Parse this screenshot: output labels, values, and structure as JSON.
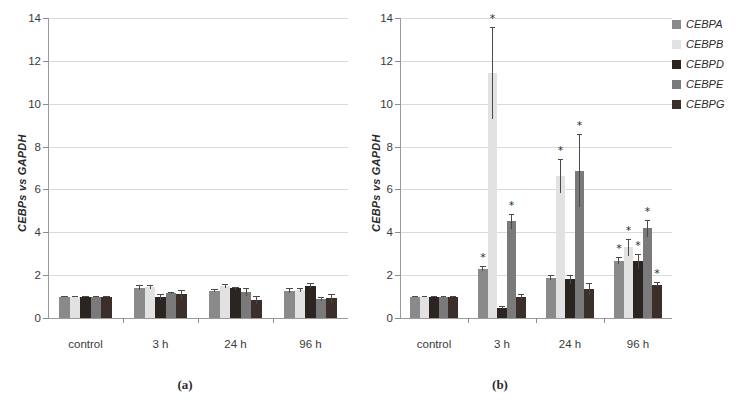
{
  "figure": {
    "panel_a_caption": "(a)",
    "panel_b_caption": "(b)"
  },
  "legend": {
    "items": [
      {
        "label": "CEBPA",
        "color": "#8a8a8a"
      },
      {
        "label": "CEBPB",
        "color": "#e2e2e2"
      },
      {
        "label": "CEBPD",
        "color": "#2b2420"
      },
      {
        "label": "CEBPE",
        "color": "#7a7a7a"
      },
      {
        "label": "CEBPG",
        "color": "#3c2e28"
      }
    ]
  },
  "axis": {
    "ylabel": "CEBPs vs GAPDH",
    "yticks": [
      "0",
      "2",
      "4",
      "6",
      "8",
      "10",
      "12",
      "14"
    ],
    "xticklabels": [
      "control",
      "3 h",
      "24 h",
      "96 h"
    ]
  },
  "chart_data": [
    {
      "type": "bar",
      "panel": "(a)",
      "title": "",
      "xlabel": "",
      "ylabel": "CEBPs vs GAPDH",
      "ylim": [
        0,
        14
      ],
      "ytick_step": 2,
      "grid": true,
      "legend_position": "right-outside-panel-b",
      "categories": [
        "control",
        "3 h",
        "24 h",
        "96 h"
      ],
      "series": [
        {
          "name": "CEBPA",
          "color": "#8a8a8a",
          "values": [
            1.0,
            1.42,
            1.28,
            1.27
          ],
          "errors": [
            0.03,
            0.12,
            0.09,
            0.12
          ],
          "significant": [
            false,
            false,
            false,
            false
          ]
        },
        {
          "name": "CEBPB",
          "color": "#e2e2e2",
          "values": [
            1.0,
            1.45,
            1.48,
            1.32
          ],
          "errors": [
            0.03,
            0.1,
            0.1,
            0.1
          ],
          "significant": [
            false,
            false,
            false,
            false
          ]
        },
        {
          "name": "CEBPD",
          "color": "#2b2420",
          "values": [
            1.0,
            0.98,
            1.38,
            1.5
          ],
          "errors": [
            0.03,
            0.12,
            0.09,
            0.12
          ],
          "significant": [
            false,
            false,
            false,
            false
          ]
        },
        {
          "name": "CEBPE",
          "color": "#7a7a7a",
          "values": [
            1.0,
            1.18,
            1.22,
            0.88
          ],
          "errors": [
            0.03,
            0.05,
            0.2,
            0.08
          ],
          "significant": [
            false,
            false,
            false,
            false
          ]
        },
        {
          "name": "CEBPG",
          "color": "#3c2e28",
          "values": [
            1.0,
            1.1,
            0.85,
            0.92
          ],
          "errors": [
            0.03,
            0.22,
            0.18,
            0.2
          ],
          "significant": [
            false,
            false,
            false,
            false
          ]
        }
      ]
    },
    {
      "type": "bar",
      "panel": "(b)",
      "title": "",
      "xlabel": "",
      "ylabel": "CEBPs vs GAPDH",
      "ylim": [
        0,
        14
      ],
      "ytick_step": 2,
      "grid": true,
      "significance_marker": "*",
      "categories": [
        "control",
        "3 h",
        "24 h",
        "96 h"
      ],
      "series": [
        {
          "name": "CEBPA",
          "color": "#8a8a8a",
          "values": [
            1.0,
            2.3,
            1.88,
            2.68
          ],
          "errors": [
            0.03,
            0.12,
            0.12,
            0.18
          ],
          "significant": [
            false,
            true,
            false,
            true
          ]
        },
        {
          "name": "CEBPB",
          "color": "#e2e2e2",
          "values": [
            1.0,
            11.42,
            6.62,
            3.3
          ],
          "errors": [
            0.03,
            2.15,
            0.8,
            0.4
          ],
          "significant": [
            false,
            true,
            true,
            true
          ]
        },
        {
          "name": "CEBPD",
          "color": "#2b2420",
          "values": [
            1.0,
            0.48,
            1.8,
            2.65
          ],
          "errors": [
            0.03,
            0.06,
            0.22,
            0.35
          ],
          "significant": [
            false,
            false,
            false,
            true
          ]
        },
        {
          "name": "CEBPE",
          "color": "#7a7a7a",
          "values": [
            1.0,
            4.52,
            6.88,
            4.18
          ],
          "errors": [
            0.03,
            0.35,
            1.7,
            0.38
          ],
          "significant": [
            false,
            true,
            true,
            true
          ]
        },
        {
          "name": "CEBPG",
          "color": "#3c2e28",
          "values": [
            1.0,
            1.0,
            1.35,
            1.55
          ],
          "errors": [
            0.03,
            0.1,
            0.28,
            0.12
          ],
          "significant": [
            false,
            false,
            false,
            true
          ]
        }
      ]
    }
  ]
}
